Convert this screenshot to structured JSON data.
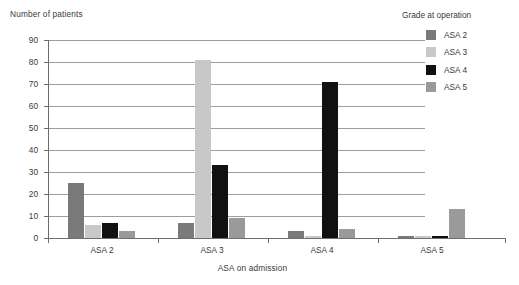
{
  "chart_data": {
    "type": "bar",
    "title": "",
    "ylabel": "Number of patients",
    "xlabel": "ASA on admission",
    "categories": [
      "ASA 2",
      "ASA 3",
      "ASA 4",
      "ASA 5"
    ],
    "ylim": [
      0,
      90
    ],
    "yticks": [
      0,
      10,
      20,
      30,
      40,
      50,
      60,
      70,
      80,
      90
    ],
    "grid": "horizontal",
    "legend_title": "Grade at operation",
    "legend_position": "right",
    "series": [
      {
        "name": "ASA 2",
        "color": "#7a7a7a",
        "values": [
          25,
          7,
          3,
          1
        ]
      },
      {
        "name": "ASA 3",
        "color": "#c8c8c8",
        "values": [
          6,
          81,
          1,
          1
        ]
      },
      {
        "name": "ASA 4",
        "color": "#111111",
        "values": [
          7,
          33,
          71,
          1
        ]
      },
      {
        "name": "ASA 5",
        "color": "#9a9a9a",
        "values": [
          3,
          9,
          4,
          13
        ]
      }
    ]
  }
}
